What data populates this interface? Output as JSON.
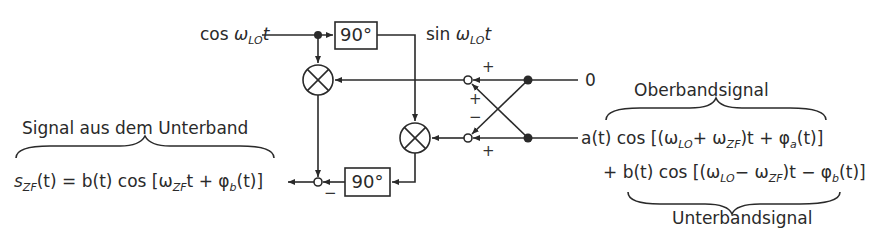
{
  "diagram": {
    "inputs": {
      "lo_in": {
        "func": "cos",
        "omega": "ω",
        "sub": "LO",
        "var": "t"
      },
      "lo_shifted": {
        "func": "sin",
        "omega": "ω",
        "sub": "LO",
        "var": "t"
      },
      "top_input": "0"
    },
    "blocks": {
      "phase_shift_top": "90°",
      "phase_shift_bottom": "90°"
    },
    "signs": {
      "top_node_right": "+",
      "top_node_cross": "+",
      "bottom_node_cross": "−",
      "bottom_node_right": "+",
      "output_node": "−"
    },
    "labels": {
      "oberband": "Oberbandsignal",
      "unterband": "Unterbandsignal",
      "signal_unterband": "Signal aus dem Unterband"
    },
    "equations": {
      "output": {
        "lhs_s": "s",
        "lhs_sub": "ZF",
        "lhs_rest": "(t) = b(t) cos [ω",
        "sub2": "ZF",
        "rest2": "t + φ",
        "sub3": "b",
        "rest3": "(t)]"
      },
      "input_line1": {
        "p1": "a(t) cos [(ω",
        "s1": "LO",
        "p2": "+ ω",
        "s2": "ZF",
        "p3": ")t + φ",
        "s3": "a",
        "p4": "(t)]"
      },
      "input_line2": {
        "p0": "+ ",
        "p1": "b(t) cos [(ω",
        "s1": "LO",
        "p2": "− ω",
        "s2": "ZF",
        "p3": ")t − φ",
        "s3": "b",
        "p4": "(t)]"
      }
    },
    "colors": {
      "line": "#2a2a2a",
      "background": "#ffffff"
    }
  }
}
